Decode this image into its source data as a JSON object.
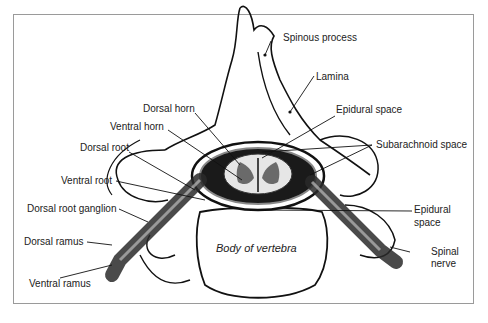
{
  "figure": {
    "labels": {
      "spinous_process": "Spinous process",
      "lamina": "Lamina",
      "dorsal_horn": "Dorsal horn",
      "ventral_horn": "Ventral horn",
      "epidural_space_top": "Epidural space",
      "subarachnoid_space": "Subarachnoid space",
      "dorsal_root": "Dorsal root",
      "ventral_root": "Ventral root",
      "dorsal_root_ganglion": "Dorsal root ganglion",
      "dorsal_ramus": "Dorsal ramus",
      "ventral_ramus": "Ventral ramus",
      "body_of_vertebra": "Body of vertebra",
      "epidural_space_right_line1": "Epidural",
      "epidural_space_right_line2": "space",
      "spinal_nerve_line1": "Spinal",
      "spinal_nerve_line2": "nerve"
    },
    "colors": {
      "outline": "#111111",
      "frame": "#9a9a9a",
      "nerve": "#2a2a2a",
      "grey_matter": "#6a6a6a"
    }
  }
}
